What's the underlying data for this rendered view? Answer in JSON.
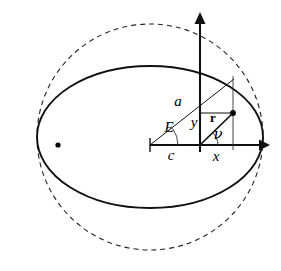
{
  "figure": {
    "background_color": "#ffffff",
    "stroke_color": "#111111",
    "width": 281,
    "height": 271
  },
  "labels": {
    "semi_major_axis": "a",
    "eccentric_anomaly": "E",
    "center_focus_distance": "c",
    "ordinate": "y",
    "abscissa": "x",
    "radius_vector": "r",
    "true_anomaly": "ν"
  },
  "geometry": {
    "circle": {
      "center_x": 150,
      "center_y": 137,
      "radius": 113,
      "style": "dashed",
      "semantic": "auxiliary-circle"
    },
    "ellipse": {
      "center_x": 150,
      "center_y": 137,
      "semi_major": 113,
      "semi_minor": 71,
      "style": "solid",
      "semantic": "orbit-ellipse"
    },
    "focus": {
      "x": 200,
      "y": 145,
      "semantic": "occupied-focus"
    },
    "empty_focus": {
      "x": 58,
      "y": 145,
      "semantic": "empty-focus-dot"
    },
    "ellipse_center_tick": {
      "x": 150,
      "y": 145
    },
    "orbit_point": {
      "x": 233,
      "y": 113,
      "semantic": "orbiting-body"
    },
    "circle_point": {
      "x": 233,
      "y": 80,
      "semantic": "projection-on-circle"
    },
    "x_axis": {
      "x1": 150,
      "y1": 145,
      "x2": 265,
      "y2": 145,
      "arrow": "right"
    },
    "y_axis": {
      "x1": 200,
      "y1": 150,
      "x2": 200,
      "y2": 15,
      "arrow": "up"
    }
  },
  "annotations": {
    "a_label_pos": {
      "x": 178,
      "y": 103
    },
    "E_label_pos": {
      "x": 169,
      "y": 129
    },
    "c_label_pos": {
      "x": 171,
      "y": 156
    },
    "y_label_pos": {
      "x": 194,
      "y": 123
    },
    "x_label_pos": {
      "x": 216,
      "y": 157
    },
    "r_label_pos": {
      "x": 213,
      "y": 119
    },
    "nu_label_pos": {
      "x": 218,
      "y": 134
    }
  }
}
